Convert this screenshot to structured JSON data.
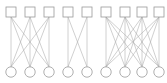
{
  "figure": {
    "width": 167,
    "height": 83,
    "background_color": "#ffffff",
    "edge_color": "#a8a8a8",
    "node_stroke_color": "#9a9a9a",
    "node_fill_color": "#ffffff",
    "edge_width": 0.55,
    "node_stroke_width": 0.8,
    "top_node_shape": "square",
    "bottom_node_shape": "circle",
    "square_size": 10,
    "circle_radius": 5.2,
    "top_row_y": 12,
    "bottom_row_y": 72
  },
  "chart_data": {
    "type": "diagram",
    "diagram_kind": "bipartite-graph",
    "components": [
      {
        "id": "component-1",
        "label": "K3,3",
        "top_count": 3,
        "bottom_count": 3,
        "edge_count": 9,
        "complete": true,
        "top_x": [
          11,
          30,
          49
        ],
        "bottom_x": [
          11,
          30,
          49
        ]
      },
      {
        "id": "component-2",
        "label": "K2,2",
        "top_count": 2,
        "bottom_count": 2,
        "edge_count": 4,
        "complete": true,
        "top_x": [
          68,
          87
        ],
        "bottom_x": [
          68,
          87
        ]
      },
      {
        "id": "component-3",
        "label": "K4,4",
        "top_count": 4,
        "bottom_count": 4,
        "edge_count": 16,
        "complete": true,
        "top_x": [
          106,
          125,
          142,
          159
        ],
        "bottom_x": [
          106,
          125,
          142,
          159
        ]
      }
    ],
    "totals": {
      "top_nodes": 9,
      "bottom_nodes": 9,
      "edges": 29,
      "components": 3
    },
    "xlabel": "",
    "ylabel": "",
    "legend": [],
    "annotations": []
  }
}
